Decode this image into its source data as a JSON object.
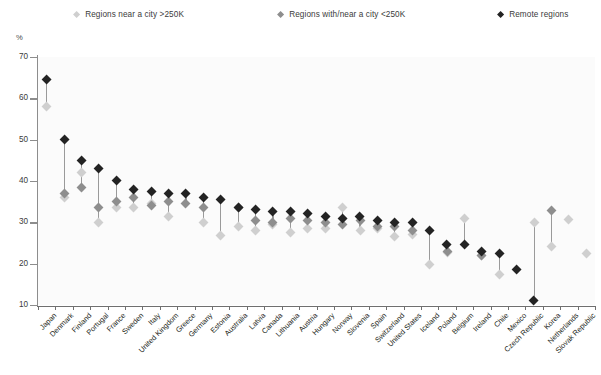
{
  "legend": {
    "items": [
      {
        "label": "Regions near a city >250K",
        "color": "#cfcfcf",
        "key": "near"
      },
      {
        "label": "Regions with/near a city <250K",
        "color": "#8e8e8e",
        "key": "mid"
      },
      {
        "label": "Remote regions",
        "color": "#232323",
        "key": "remote"
      }
    ]
  },
  "axis": {
    "unit": "%",
    "yticks": [
      "70",
      "60",
      "50",
      "40",
      "30",
      "20",
      "10"
    ]
  },
  "chart_data": {
    "type": "scatter",
    "title": "",
    "subtitle": "",
    "xlabel": "",
    "ylabel": "%",
    "ylim": [
      10,
      70
    ],
    "ytick_step": 10,
    "grid": false,
    "legend_position": "top",
    "categories": [
      "Japan",
      "Denmark",
      "Finland",
      "Portugal",
      "France",
      "Sweden",
      "Italy",
      "United Kingdom",
      "Greece",
      "Germany",
      "Estonia",
      "Australia",
      "Latvia",
      "Canada",
      "Lithuania",
      "Austria",
      "Hungary",
      "Norway",
      "Slovenia",
      "Spain",
      "Switzerland",
      "United States",
      "Iceland",
      "Poland",
      "Belgium",
      "Ireland",
      "Chile",
      "Mexico",
      "Czech Republic",
      "Korea",
      "Netherlands",
      "Slovak Republic"
    ],
    "series": [
      {
        "name": "Regions near a city >250K",
        "color": "#cfcfcf",
        "values": [
          58.0,
          36.0,
          42.0,
          30.0,
          33.5,
          33.5,
          34.5,
          31.5,
          null,
          30.0,
          26.7,
          29.0,
          28.0,
          29.5,
          27.5,
          28.5,
          28.5,
          33.5,
          28.0,
          28.5,
          26.5,
          27.0,
          19.8,
          22.8,
          31.0,
          22.0,
          17.3,
          null,
          30.0,
          24.2,
          30.7,
          22.5
        ]
      },
      {
        "name": "Regions with/near a city <250K",
        "color": "#8e8e8e",
        "values": [
          null,
          37.0,
          38.5,
          33.5,
          35.0,
          36.0,
          34.0,
          35.0,
          34.5,
          33.5,
          null,
          33.5,
          30.5,
          30.0,
          31.0,
          30.5,
          30.0,
          29.5,
          30.5,
          29.0,
          29.0,
          28.0,
          null,
          23.0,
          null,
          22.0,
          null,
          null,
          null,
          32.8,
          null,
          null
        ]
      },
      {
        "name": "Remote regions",
        "color": "#232323",
        "values": [
          64.5,
          50.0,
          45.0,
          43.0,
          40.0,
          38.0,
          37.5,
          37.0,
          37.0,
          36.0,
          35.5,
          33.5,
          33.0,
          32.5,
          32.5,
          32.0,
          31.5,
          31.0,
          31.5,
          30.5,
          30.0,
          30.0,
          28.0,
          24.5,
          24.5,
          23.0,
          22.5,
          18.5,
          11.0,
          null,
          null,
          null
        ]
      }
    ]
  }
}
